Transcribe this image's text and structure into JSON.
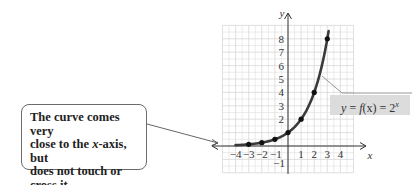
{
  "chart_data": {
    "type": "line",
    "title": "",
    "function_label": "y = f(x) = 2^x",
    "xlabel": "x",
    "ylabel": "y",
    "xlim": [
      -5,
      5
    ],
    "ylim": [
      -2,
      9
    ],
    "grid": true,
    "x_ticks": [
      -4,
      -3,
      -2,
      -1,
      1,
      2,
      3,
      4
    ],
    "y_ticks": [
      -1,
      1,
      2,
      3,
      4,
      5,
      6,
      7,
      8
    ],
    "x_tick_labels": [
      "−4",
      "−3",
      "−2",
      "−1",
      "1",
      "2",
      "3",
      "4"
    ],
    "y_tick_labels": [
      "−1",
      "2",
      "3",
      "4",
      "5",
      "6",
      "7",
      "8"
    ],
    "series": [
      {
        "name": "f(x) = 2^x",
        "points": [
          {
            "x": -3,
            "y": 0.125
          },
          {
            "x": -2,
            "y": 0.25
          },
          {
            "x": -1,
            "y": 0.5
          },
          {
            "x": 0,
            "y": 1
          },
          {
            "x": 1,
            "y": 2
          },
          {
            "x": 2,
            "y": 4
          },
          {
            "x": 3,
            "y": 8
          }
        ],
        "curve_domain": [
          -4,
          3.1
        ]
      }
    ],
    "annotations": [
      {
        "text": "The curve comes very close to the x-axis, but does not touch or cross it.",
        "points_to": {
          "x": -4.5,
          "y": 0
        }
      }
    ],
    "colors": {
      "curve": "#3a3a3a",
      "grid": "#d8d8d8",
      "axis": "#333333",
      "label_box": "#dcdcdc",
      "callout_border": "#6b6b6b"
    }
  },
  "callout": {
    "line1": "The curve comes very",
    "line2_pre": "close to the ",
    "line2_var": "x",
    "line2_post": "-axis, but",
    "line3": "does not touch or",
    "line4": "cross it."
  },
  "equation": {
    "lhs": "y",
    "eq1": " = ",
    "fx": "f",
    "paren": "(x)",
    "eq2": " = 2",
    "exp": "x"
  }
}
